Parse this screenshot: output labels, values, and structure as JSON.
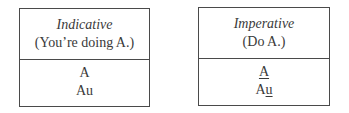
{
  "boxes": [
    {
      "title": "Indicative",
      "subtitle": "(You’re doing A.)",
      "lines": [
        {
          "parts": [
            {
              "text": "A",
              "underline": false
            }
          ]
        },
        {
          "parts": [
            {
              "text": "Au",
              "underline": false
            }
          ]
        }
      ]
    },
    {
      "title": "Imperative",
      "subtitle": "(Do A.)",
      "lines": [
        {
          "parts": [
            {
              "text": "A",
              "underline": true
            }
          ]
        },
        {
          "parts": [
            {
              "text": "A",
              "underline": false
            },
            {
              "text": "u",
              "underline": true
            }
          ]
        }
      ]
    }
  ]
}
